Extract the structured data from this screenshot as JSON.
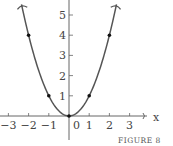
{
  "chart_data": {
    "type": "line",
    "title": "",
    "caption": "FIGURE 8",
    "xlabel": "x",
    "ylabel": "",
    "function": "y = x^2",
    "xlim": [
      -3.4,
      4.9
    ],
    "ylim": [
      -1.3,
      5.8
    ],
    "x_ticks": [
      -3,
      -2,
      -1,
      0,
      1,
      2,
      3
    ],
    "x_tick_labels": [
      "−3",
      "−2",
      "−1",
      "0",
      "1",
      "2",
      "3"
    ],
    "y_ticks": [
      1,
      2,
      3,
      4,
      5
    ],
    "y_tick_labels": [
      "1",
      "2",
      "3",
      "4",
      "5"
    ],
    "grid": false,
    "legend": null,
    "marked_points": [
      {
        "x": -2,
        "y": 4
      },
      {
        "x": -1,
        "y": 1
      },
      {
        "x": 0,
        "y": 0
      },
      {
        "x": 1,
        "y": 1
      },
      {
        "x": 2,
        "y": 4
      }
    ],
    "curve_samples": {
      "x": [
        -2.35,
        -2,
        -1.5,
        -1,
        -0.5,
        0,
        0.5,
        1,
        1.5,
        2,
        2.35
      ],
      "y": [
        5.52,
        4,
        2.25,
        1,
        0.25,
        0,
        0.25,
        1,
        2.25,
        4,
        5.52
      ]
    },
    "colors": {
      "curve": "#555555",
      "axes": "#666666",
      "points": "#111111"
    }
  }
}
